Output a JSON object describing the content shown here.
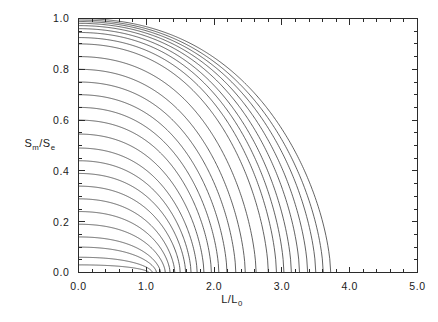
{
  "figure": {
    "background_color": "#ffffff",
    "line_color": "#2f2f2f",
    "axis_color": "#2b2b2b",
    "caption": ""
  },
  "chart_data": {
    "type": "line",
    "title": "",
    "subtitle": "",
    "xlabel": "L/L_0",
    "xlabel_main": "L/L",
    "xlabel_sub": "0",
    "ylabel": "S_m/S_e",
    "ylabel_parts": {
      "s1": "S",
      "sub1": "m",
      "slash": "/",
      "s2": "S",
      "sub2": "e"
    },
    "xlim": [
      0.0,
      5.0
    ],
    "ylim": [
      0.0,
      1.0
    ],
    "grid": false,
    "legend": "none",
    "xticks": [
      0.0,
      1.0,
      2.0,
      3.0,
      4.0,
      5.0
    ],
    "xticklabels": [
      "0.0",
      "1.0",
      "2.0",
      "3.0",
      "4.0",
      "5.0"
    ],
    "xminor_step": 0.2,
    "yticks": [
      0.0,
      0.2,
      0.4,
      0.6,
      0.8,
      1.0
    ],
    "yticklabels": [
      "0.0",
      "0.2",
      "0.4",
      "0.6",
      "0.8",
      "1.0"
    ],
    "yminor_step": 0.05,
    "n_curves": 28,
    "series": [
      {
        "name": "c01",
        "y0": 0.0,
        "x_end": 1.0
      },
      {
        "name": "c02",
        "y0": 0.03,
        "x_end": 1.04
      },
      {
        "name": "c03",
        "y0": 0.06,
        "x_end": 1.09
      },
      {
        "name": "c04",
        "y0": 0.1,
        "x_end": 1.15
      },
      {
        "name": "c05",
        "y0": 0.14,
        "x_end": 1.21
      },
      {
        "name": "c06",
        "y0": 0.19,
        "x_end": 1.28
      },
      {
        "name": "c07",
        "y0": 0.24,
        "x_end": 1.35
      },
      {
        "name": "c08",
        "y0": 0.29,
        "x_end": 1.42
      },
      {
        "name": "c09",
        "y0": 0.34,
        "x_end": 1.5
      },
      {
        "name": "c10",
        "y0": 0.39,
        "x_end": 1.58
      },
      {
        "name": "c11",
        "y0": 0.44,
        "x_end": 1.66
      },
      {
        "name": "c12",
        "y0": 0.49,
        "x_end": 1.75
      },
      {
        "name": "c13",
        "y0": 0.545,
        "x_end": 1.85
      },
      {
        "name": "c14",
        "y0": 0.6,
        "x_end": 1.96
      },
      {
        "name": "c15",
        "y0": 0.65,
        "x_end": 2.07
      },
      {
        "name": "c16",
        "y0": 0.7,
        "x_end": 2.19
      },
      {
        "name": "c17",
        "y0": 0.75,
        "x_end": 2.32
      },
      {
        "name": "c18",
        "y0": 0.8,
        "x_end": 2.46
      },
      {
        "name": "c19",
        "y0": 0.85,
        "x_end": 2.62
      },
      {
        "name": "c20",
        "y0": 0.9,
        "x_end": 2.8
      },
      {
        "name": "c21",
        "y0": 0.925,
        "x_end": 2.92
      },
      {
        "name": "c22",
        "y0": 0.945,
        "x_end": 3.03
      },
      {
        "name": "c23",
        "y0": 0.96,
        "x_end": 3.14
      },
      {
        "name": "c24",
        "y0": 0.972,
        "x_end": 3.26
      },
      {
        "name": "c25",
        "y0": 0.981,
        "x_end": 3.38
      },
      {
        "name": "c26",
        "y0": 0.988,
        "x_end": 3.5
      },
      {
        "name": "c27",
        "y0": 0.994,
        "x_end": 3.61
      },
      {
        "name": "c28",
        "y0": 1.0,
        "x_end": 3.72
      }
    ]
  }
}
